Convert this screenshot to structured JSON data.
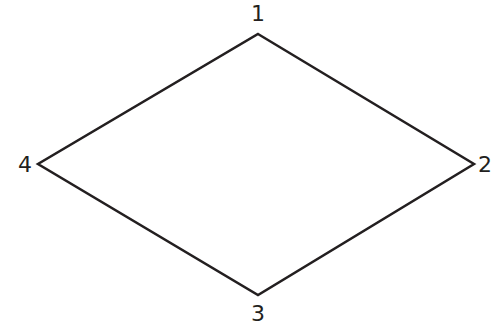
{
  "diagram": {
    "shape": "rhombus",
    "stroke_color": "#231f20",
    "stroke_width": 2.5,
    "vertices": [
      {
        "label": "1",
        "x": 258,
        "y": 34
      },
      {
        "label": "2",
        "x": 474,
        "y": 164
      },
      {
        "label": "3",
        "x": 258,
        "y": 295
      },
      {
        "label": "4",
        "x": 38,
        "y": 164
      }
    ]
  }
}
